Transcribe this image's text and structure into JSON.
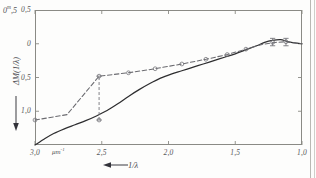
{
  "figure": {
    "kind": "line-chart",
    "background_color": "#fdfdfc",
    "axis_color": "#8a8a85",
    "solid_curve_color": "#2e2e30",
    "dashed_curve_color": "#6b6b70",
    "label_color": "#57575a"
  },
  "axes": {
    "y_corner_label_value": "0",
    "y_corner_label_sup": "m",
    "y_corner_label_frac": ",5",
    "y_title": "ΔM(1/λ)",
    "y_arrow": "down-arrow",
    "y_ticks": [
      {
        "label": "0,5",
        "value": -0.5
      },
      {
        "label": "0",
        "value": 0
      },
      {
        "label": "0,5",
        "value": 0.5
      },
      {
        "label": "1,0",
        "value": 1.0
      },
      {
        "label": "1,5",
        "value": 1.5
      }
    ],
    "x_title": "1/λ",
    "x_arrow": "left-arrow",
    "x_unit": "μm",
    "x_unit_sup": "-1",
    "x_ticks": [
      {
        "label": "3,0",
        "value": 3.0
      },
      {
        "label": "2,5",
        "value": 2.5
      },
      {
        "label": "2,0",
        "value": 2.0
      },
      {
        "label": "1,5",
        "value": 1.5
      },
      {
        "label": "1,0",
        "value": 1.0
      }
    ]
  },
  "chart_data": {
    "type": "line",
    "title": "",
    "xlabel": "1/λ",
    "ylabel": "ΔM(1/λ)",
    "xlim": [
      3.0,
      1.0
    ],
    "ylim": [
      1.5,
      -0.5
    ],
    "x_inverted": true,
    "y_inverted": true,
    "grid": false,
    "legend": "none",
    "series": [
      {
        "name": "solid-curve",
        "style": "solid",
        "color": "#2e2e30",
        "points": [
          {
            "x": 3.0,
            "y": 1.5
          },
          {
            "x": 2.93,
            "y": 1.41
          },
          {
            "x": 2.86,
            "y": 1.33
          },
          {
            "x": 2.78,
            "y": 1.26
          },
          {
            "x": 2.7,
            "y": 1.2
          },
          {
            "x": 2.62,
            "y": 1.14
          },
          {
            "x": 2.54,
            "y": 1.07
          },
          {
            "x": 2.46,
            "y": 0.99
          },
          {
            "x": 2.38,
            "y": 0.89
          },
          {
            "x": 2.3,
            "y": 0.78
          },
          {
            "x": 2.22,
            "y": 0.68
          },
          {
            "x": 2.14,
            "y": 0.59
          },
          {
            "x": 2.06,
            "y": 0.51
          },
          {
            "x": 1.98,
            "y": 0.45
          },
          {
            "x": 1.9,
            "y": 0.4
          },
          {
            "x": 1.82,
            "y": 0.35
          },
          {
            "x": 1.74,
            "y": 0.3
          },
          {
            "x": 1.66,
            "y": 0.25
          },
          {
            "x": 1.58,
            "y": 0.2
          },
          {
            "x": 1.5,
            "y": 0.15
          },
          {
            "x": 1.42,
            "y": 0.09
          },
          {
            "x": 1.34,
            "y": 0.03
          },
          {
            "x": 1.28,
            "y": -0.02
          },
          {
            "x": 1.22,
            "y": -0.05
          },
          {
            "x": 1.16,
            "y": -0.06
          },
          {
            "x": 1.12,
            "y": -0.04
          },
          {
            "x": 1.08,
            "y": -0.02
          },
          {
            "x": 1.04,
            "y": -0.01
          },
          {
            "x": 1.0,
            "y": 0.0
          }
        ]
      },
      {
        "name": "dashed-curve",
        "style": "dashed",
        "color": "#6b6b70",
        "points": [
          {
            "x": 3.0,
            "y": 1.13
          },
          {
            "x": 2.76,
            "y": 1.05
          },
          {
            "x": 2.52,
            "y": 0.48
          },
          {
            "x": 2.3,
            "y": 0.43
          },
          {
            "x": 2.1,
            "y": 0.37
          },
          {
            "x": 1.9,
            "y": 0.3
          },
          {
            "x": 1.72,
            "y": 0.23
          },
          {
            "x": 1.56,
            "y": 0.16
          },
          {
            "x": 1.42,
            "y": 0.08
          },
          {
            "x": 1.3,
            "y": 0.01
          },
          {
            "x": 1.2,
            "y": -0.02
          },
          {
            "x": 1.12,
            "y": -0.03
          },
          {
            "x": 1.05,
            "y": -0.01
          },
          {
            "x": 1.0,
            "y": 0.0
          }
        ]
      }
    ],
    "data_points": [
      {
        "x": 3.0,
        "y": 1.13
      },
      {
        "x": 2.52,
        "y": 0.48
      },
      {
        "x": 2.52,
        "y": 1.13
      },
      {
        "x": 2.3,
        "y": 0.43
      },
      {
        "x": 2.1,
        "y": 0.37
      },
      {
        "x": 1.9,
        "y": 0.3
      },
      {
        "x": 1.72,
        "y": 0.23
      },
      {
        "x": 1.56,
        "y": 0.16
      },
      {
        "x": 1.42,
        "y": 0.08
      },
      {
        "x": 1.22,
        "y": -0.02
      },
      {
        "x": 1.12,
        "y": -0.03
      }
    ],
    "error_bars": [
      {
        "x": 2.52,
        "y_low": 1.13,
        "y_high": 0.48,
        "orientation": "vertical"
      },
      {
        "x": 1.22,
        "y_low": 0.03,
        "y_high": -0.08,
        "orientation": "vertical"
      },
      {
        "x": 1.12,
        "y_low": 0.03,
        "y_high": -0.08,
        "orientation": "vertical"
      }
    ]
  }
}
